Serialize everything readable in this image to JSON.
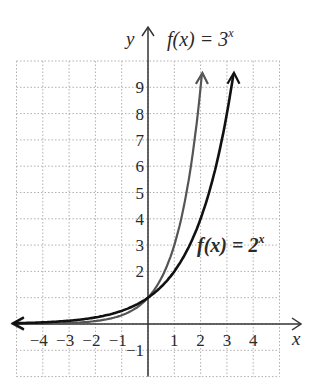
{
  "chart_data": {
    "type": "line",
    "title": "",
    "xlabel": "x",
    "ylabel": "y",
    "xlim": [
      -5,
      5
    ],
    "ylim": [
      -2,
      10
    ],
    "grid": true,
    "x_ticks": [
      "-4",
      "-3",
      "-2",
      "-1",
      "1",
      "2",
      "3",
      "4"
    ],
    "y_ticks": [
      "-1",
      "2",
      "3",
      "4",
      "5",
      "6",
      "7",
      "8",
      "9"
    ],
    "series": [
      {
        "name": "f(x) = 3^x",
        "label_main": "f(x) = 3",
        "label_exp": "x",
        "color": "#555555",
        "x": [
          -5,
          -4,
          -3,
          -2,
          -1,
          0,
          1,
          2,
          2.05
        ],
        "y": [
          0.004,
          0.012,
          0.037,
          0.111,
          0.333,
          1,
          3,
          9,
          9.5
        ]
      },
      {
        "name": "f(x) = 2^x",
        "label_main": "f(x) = 2",
        "label_exp": "x",
        "color": "#111111",
        "x": [
          -5,
          -4,
          -3,
          -2,
          -1,
          0,
          1,
          2,
          3,
          3.25
        ],
        "y": [
          0.031,
          0.0625,
          0.125,
          0.25,
          0.5,
          1,
          2,
          4,
          8,
          9.5
        ]
      }
    ]
  }
}
